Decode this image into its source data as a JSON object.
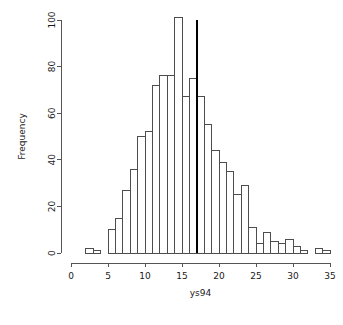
{
  "chart_data": {
    "type": "bar",
    "title": "",
    "subtitle": "",
    "xlabel": "ys94",
    "ylabel": "Frequency",
    "xlim": [
      0,
      35
    ],
    "ylim": [
      0,
      101
    ],
    "grid": false,
    "legend": null,
    "bin_width": 1,
    "categories": [
      "2-3",
      "3-4",
      "4-5",
      "5-6",
      "6-7",
      "7-8",
      "8-9",
      "9-10",
      "10-11",
      "11-12",
      "12-13",
      "13-14",
      "14-15",
      "15-16",
      "16-17",
      "17-18",
      "18-19",
      "19-20",
      "20-21",
      "21-22",
      "22-23",
      "23-24",
      "24-25",
      "25-26",
      "26-27",
      "27-28",
      "28-29",
      "29-30",
      "30-31",
      "31-32",
      "32-33",
      "33-34",
      "34-35"
    ],
    "bin_starts": [
      2,
      3,
      4,
      5,
      6,
      7,
      8,
      9,
      10,
      11,
      12,
      13,
      14,
      15,
      16,
      17,
      18,
      19,
      20,
      21,
      22,
      23,
      24,
      25,
      26,
      27,
      28,
      29,
      30,
      31,
      32,
      33,
      34
    ],
    "values": [
      2,
      1,
      0,
      10,
      15,
      27,
      36,
      50,
      52,
      72,
      76,
      76,
      101,
      67,
      75,
      67,
      55,
      44,
      39,
      35,
      25,
      29,
      11,
      4,
      9,
      5,
      4,
      6,
      3,
      1,
      0,
      2,
      1
    ],
    "x_ticks": [
      0,
      5,
      10,
      15,
      20,
      25,
      30,
      35
    ],
    "x_tick_labels": [
      "0",
      "5",
      "10",
      "15",
      "20",
      "25",
      "30",
      "35"
    ],
    "y_ticks": [
      0,
      20,
      40,
      60,
      80,
      100
    ],
    "y_tick_labels": [
      "0",
      "20",
      "40",
      "60",
      "80",
      "100"
    ],
    "annotations": [
      {
        "name": "reference-vline",
        "type": "vertical-line",
        "x": 17,
        "y_top": 100,
        "color": "#000000"
      }
    ],
    "colors": {
      "bar_fill": "#ffffff",
      "bar_stroke": "#4d4d4d",
      "axis": "#555555",
      "text": "#1a1a1a",
      "vline": "#000000"
    }
  }
}
